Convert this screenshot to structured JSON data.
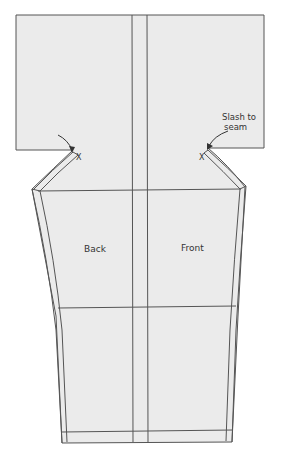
{
  "diagram": {
    "type": "sewing-pattern",
    "colors": {
      "fill": "#ebebeb",
      "line": "#555555",
      "background": "#ffffff",
      "text": "#333333"
    },
    "labels": {
      "back": "Back",
      "front": "Front",
      "slash_note_line1": "Slash to",
      "slash_note_line2": "seam",
      "mark_left": "X",
      "mark_right": "X"
    },
    "guides": {
      "center_lines_x": [
        132,
        147
      ],
      "horizontal_lines_y": [
        190,
        308,
        432
      ]
    }
  }
}
